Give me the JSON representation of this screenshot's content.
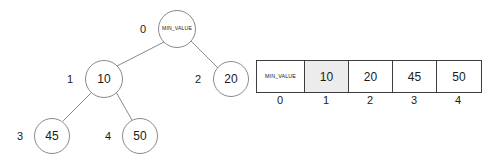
{
  "diagram": {
    "type": "binary-heap",
    "tree": {
      "nodes": [
        {
          "index": "0",
          "value": "MIN_VALUE",
          "size": "small",
          "cx": 177,
          "cy": 29,
          "r": 19,
          "label_x": 140,
          "label_y": 24
        },
        {
          "index": "1",
          "value": "10",
          "size": "big",
          "cx": 104,
          "cy": 79,
          "r": 19,
          "label_x": 67,
          "label_y": 74
        },
        {
          "index": "2",
          "value": "20",
          "size": "big",
          "cx": 231,
          "cy": 79,
          "r": 18,
          "label_x": 195,
          "label_y": 74
        },
        {
          "index": "3",
          "value": "45",
          "size": "big",
          "cx": 52,
          "cy": 136,
          "r": 18,
          "label_x": 17,
          "label_y": 131
        },
        {
          "index": "4",
          "value": "50",
          "size": "big",
          "cx": 140,
          "cy": 136,
          "r": 18,
          "label_x": 105,
          "label_y": 131
        }
      ],
      "edges": [
        {
          "from": "0",
          "to": "1",
          "x1": 164,
          "y1": 42,
          "x2": 117,
          "y2": 66
        },
        {
          "from": "0",
          "to": "2",
          "x1": 191,
          "y1": 41,
          "x2": 218,
          "y2": 68
        },
        {
          "from": "1",
          "to": "3",
          "x1": 92,
          "y1": 92,
          "x2": 63,
          "y2": 121
        },
        {
          "from": "1",
          "to": "4",
          "x1": 116,
          "y1": 92,
          "x2": 132,
          "y2": 120
        }
      ],
      "edge_color": "#8a8a8a"
    },
    "array": {
      "cells": [
        {
          "value": "MIN_VALUE",
          "size": "small",
          "index": "0",
          "width": 48,
          "highlight": false
        },
        {
          "value": "10",
          "size": "big",
          "index": "1",
          "width": 44,
          "highlight": true
        },
        {
          "value": "20",
          "size": "big",
          "index": "2",
          "width": 44,
          "highlight": false
        },
        {
          "value": "45",
          "size": "big",
          "index": "3",
          "width": 44,
          "highlight": false
        },
        {
          "value": "50",
          "size": "big",
          "index": "4",
          "width": 44,
          "highlight": false
        }
      ],
      "highlight_color": "#ececec",
      "border_color": "#3d3d3d"
    }
  }
}
